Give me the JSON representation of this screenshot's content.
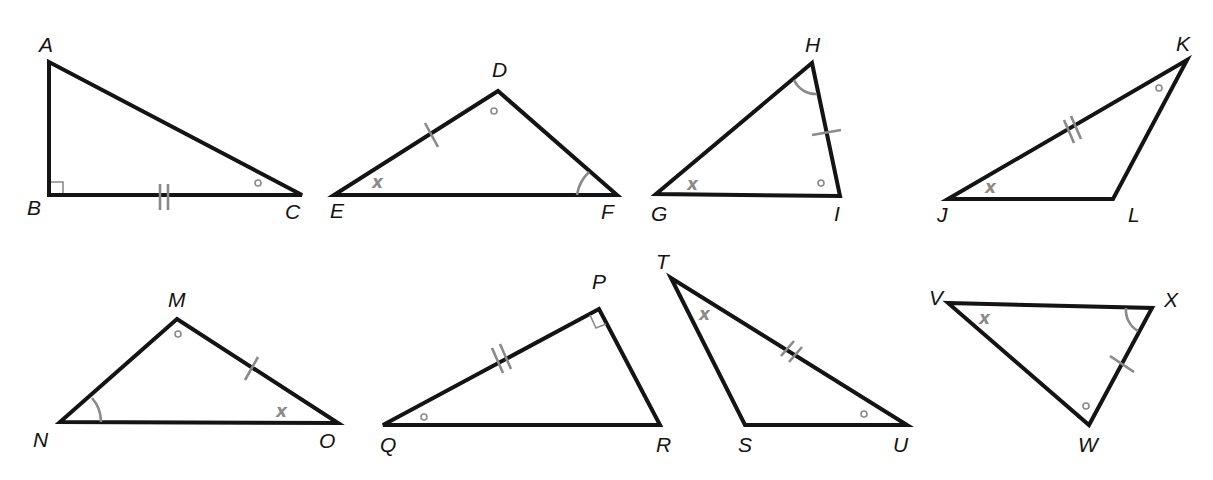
{
  "figure": {
    "colors": {
      "stroke": "#141414",
      "marks": "#8a8a8a",
      "background": "#ffffff"
    }
  },
  "triangles": [
    {
      "name": "ABC",
      "vertices": {
        "A": [
          49,
          62
        ],
        "B": [
          49,
          195
        ],
        "C": [
          302,
          195
        ]
      },
      "labels": {
        "A": "A",
        "B": "B",
        "C": "C"
      },
      "markings": {
        "right_angle": "B",
        "circle_angle": "C",
        "double_tick_side": "BC"
      }
    },
    {
      "name": "DEF",
      "vertices": {
        "D": [
          498,
          91
        ],
        "E": [
          334,
          195
        ],
        "F": [
          617,
          195
        ]
      },
      "labels": {
        "D": "D",
        "E": "E",
        "F": "F"
      },
      "markings": {
        "x_angle": "E",
        "circle_angle": "D",
        "arc_angle": "F",
        "single_tick_side": "DE"
      }
    },
    {
      "name": "GHI",
      "vertices": {
        "G": [
          656,
          194
        ],
        "H": [
          812,
          63
        ],
        "I": [
          840,
          196
        ]
      },
      "labels": {
        "G": "G",
        "H": "H",
        "I": "I"
      },
      "markings": {
        "x_angle": "G",
        "circle_angle": "I",
        "arc_angle": "H",
        "single_tick_side": "HI"
      }
    },
    {
      "name": "JKL",
      "vertices": {
        "J": [
          948,
          199
        ],
        "K": [
          1187,
          60
        ],
        "L": [
          1113,
          199
        ]
      },
      "labels": {
        "J": "J",
        "K": "K",
        "L": "L"
      },
      "markings": {
        "x_angle": "J",
        "circle_angle": "K",
        "double_tick_side": "JK"
      }
    },
    {
      "name": "MNO",
      "vertices": {
        "M": [
          177,
          319
        ],
        "N": [
          60,
          422
        ],
        "O": [
          338,
          423
        ]
      },
      "labels": {
        "M": "M",
        "N": "N",
        "O": "O"
      },
      "markings": {
        "x_angle": "O",
        "circle_angle": "M",
        "arc_angle": "N",
        "single_tick_side": "MO"
      }
    },
    {
      "name": "PQR",
      "vertices": {
        "P": [
          599,
          309
        ],
        "Q": [
          383,
          425
        ],
        "R": [
          660,
          425
        ]
      },
      "labels": {
        "P": "P",
        "Q": "Q",
        "R": "R"
      },
      "markings": {
        "right_angle": "P",
        "circle_angle": "Q",
        "double_tick_side": "PQ"
      }
    },
    {
      "name": "TSU",
      "vertices": {
        "T": [
          671,
          278
        ],
        "S": [
          745,
          425
        ],
        "U": [
          907,
          425
        ]
      },
      "labels": {
        "T": "T",
        "S": "S",
        "U": "U"
      },
      "markings": {
        "x_angle": "T",
        "circle_angle": "U",
        "double_tick_side": "TU"
      }
    },
    {
      "name": "VWX",
      "vertices": {
        "V": [
          948,
          303
        ],
        "X": [
          1152,
          308
        ],
        "W": [
          1089,
          425
        ]
      },
      "labels": {
        "V": "V",
        "W": "W",
        "X": "X"
      },
      "markings": {
        "x_angle": "V",
        "circle_angle": "W",
        "arc_angle": "X",
        "single_tick_side": "XW"
      }
    }
  ],
  "angle_symbol": {
    "x": "x"
  }
}
